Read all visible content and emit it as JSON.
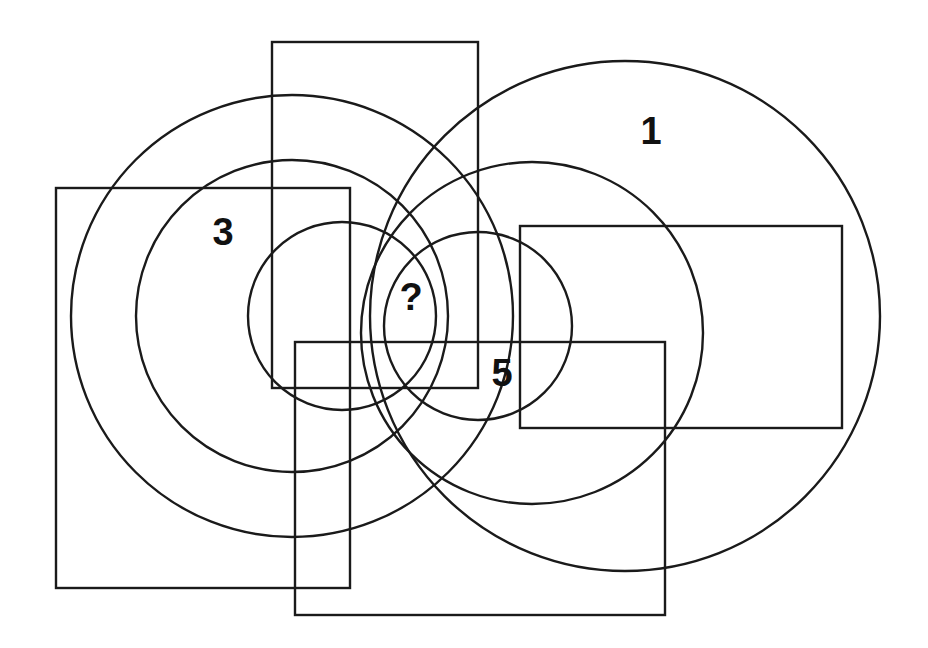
{
  "puzzle": {
    "type": "overlapping-shapes-logic-puzzle",
    "stroke_color": "#1a1a1a",
    "background_color": "#ffffff",
    "circles": [
      {
        "id": "left-outer",
        "cx": 292,
        "cy": 316,
        "r": 221
      },
      {
        "id": "left-middle",
        "cx": 292,
        "cy": 316,
        "r": 156
      },
      {
        "id": "left-inner",
        "cx": 342,
        "cy": 316,
        "r": 94
      },
      {
        "id": "right-outer",
        "cx": 625,
        "cy": 316,
        "r": 255
      },
      {
        "id": "right-middle",
        "cx": 532,
        "cy": 333,
        "r": 171
      },
      {
        "id": "right-inner",
        "cx": 478,
        "cy": 326,
        "r": 94
      }
    ],
    "rectangles": [
      {
        "id": "top-middle",
        "x": 272,
        "y": 42,
        "w": 206,
        "h": 346
      },
      {
        "id": "left",
        "x": 56,
        "y": 188,
        "w": 294,
        "h": 400
      },
      {
        "id": "right",
        "x": 520,
        "y": 226,
        "w": 322,
        "h": 202
      },
      {
        "id": "bottom",
        "x": 295,
        "y": 342,
        "w": 370,
        "h": 273
      }
    ],
    "labels": [
      {
        "id": "label-1",
        "text": "1",
        "x": 651,
        "y": 134
      },
      {
        "id": "label-3",
        "text": "3",
        "x": 223,
        "y": 235
      },
      {
        "id": "label-question",
        "text": "?",
        "x": 411,
        "y": 300
      },
      {
        "id": "label-5",
        "text": "5",
        "x": 502,
        "y": 376
      }
    ]
  }
}
